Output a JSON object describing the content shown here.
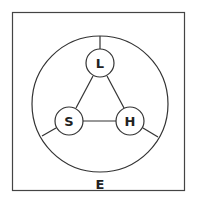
{
  "diagram": {
    "frame_label": "E",
    "nodes": [
      {
        "id": "L",
        "label": "L",
        "cx": 100,
        "cy": 63
      },
      {
        "id": "S",
        "label": "S",
        "cx": 69,
        "cy": 121
      },
      {
        "id": "H",
        "label": "H",
        "cx": 130,
        "cy": 121
      }
    ],
    "edges": [
      [
        "L",
        "S"
      ],
      [
        "L",
        "H"
      ],
      [
        "S",
        "H"
      ]
    ],
    "colors": {
      "stroke": "#333333",
      "background": "#ffffff"
    }
  }
}
